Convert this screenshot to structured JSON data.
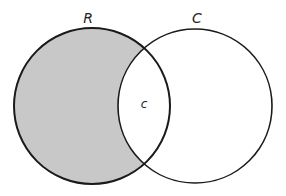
{
  "diagram": {
    "type": "venn",
    "sets": [
      {
        "label": "R",
        "cx": 92,
        "cy": 106,
        "r": 78,
        "shaded_exclusive": true
      },
      {
        "label": "C",
        "cx": 195,
        "cy": 106,
        "r": 77,
        "shaded_exclusive": false
      }
    ],
    "intersection_label": "c",
    "colors": {
      "shade": "#c8c8c8",
      "stroke": "#1a1a1a",
      "background": "#ffffff"
    }
  }
}
